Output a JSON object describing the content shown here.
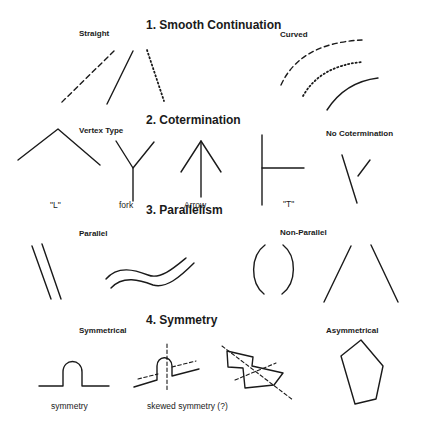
{
  "sections": [
    {
      "title": "1.  Smooth Continuation",
      "groups": [
        {
          "label": "Straight",
          "items": [
            "dashed line",
            "solid line",
            "dotted line"
          ]
        },
        {
          "label": "Curved",
          "items": [
            "dashed arc",
            "dotted arc",
            "solid arc"
          ]
        }
      ]
    },
    {
      "title": "2.  Cotermination",
      "groups": [
        {
          "label": "Vertex Type",
          "captions": [
            "\"L\"",
            "fork",
            "Arrow",
            "\"T\""
          ]
        },
        {
          "label": "No Cotermination"
        }
      ]
    },
    {
      "title": "3.  Parallelism",
      "groups": [
        {
          "label": "Parallel"
        },
        {
          "label": "Non-Parallel"
        }
      ]
    },
    {
      "title": "4.  Symmetry",
      "groups": [
        {
          "label": "Symmetrical",
          "captions": [
            "symmetry",
            "skewed symmetry (?)"
          ]
        },
        {
          "label": "Asymmetrical"
        }
      ]
    }
  ]
}
